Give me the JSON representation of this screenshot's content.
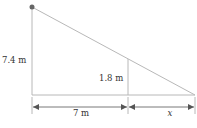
{
  "diagram": {
    "type": "similar-triangles-shadow",
    "labels": {
      "pole_height": "7.4 m",
      "person_height": "1.8 m",
      "distance": "7 m",
      "shadow": "x"
    },
    "colors": {
      "line": "#b8b8b8",
      "dot": "#666666",
      "text": "#333333",
      "arrow": "#555555"
    }
  }
}
